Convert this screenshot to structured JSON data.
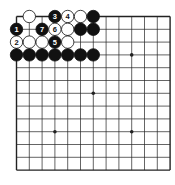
{
  "board": {
    "size": 13,
    "origin": [
      16.5,
      16.5
    ],
    "spacing": 12.8,
    "star_points": [
      [
        3,
        3
      ],
      [
        9,
        3
      ],
      [
        6,
        6
      ],
      [
        3,
        9
      ],
      [
        9,
        9
      ]
    ],
    "colors": {
      "line": "#222222",
      "black": "#111111",
      "white": "#ffffff",
      "background": "#ffffff"
    }
  },
  "stones": [
    {
      "col": 1,
      "row": 0,
      "color": "white",
      "label": ""
    },
    {
      "col": 3,
      "row": 0,
      "color": "black",
      "label": "3"
    },
    {
      "col": 4,
      "row": 0,
      "color": "white",
      "label": "4"
    },
    {
      "col": 5,
      "row": 0,
      "color": "white",
      "label": ""
    },
    {
      "col": 6,
      "row": 0,
      "color": "black",
      "label": ""
    },
    {
      "col": 0,
      "row": 1,
      "color": "black",
      "label": "1"
    },
    {
      "col": 2,
      "row": 1,
      "color": "black",
      "label": "7"
    },
    {
      "col": 3,
      "row": 1,
      "color": "white",
      "label": "6"
    },
    {
      "col": 4,
      "row": 1,
      "color": "white",
      "label": ""
    },
    {
      "col": 5,
      "row": 1,
      "color": "black",
      "label": ""
    },
    {
      "col": 6,
      "row": 1,
      "color": "black",
      "label": ""
    },
    {
      "col": 0,
      "row": 2,
      "color": "white",
      "label": "2"
    },
    {
      "col": 1,
      "row": 2,
      "color": "white",
      "label": ""
    },
    {
      "col": 2,
      "row": 2,
      "color": "white",
      "label": ""
    },
    {
      "col": 3,
      "row": 2,
      "color": "black",
      "label": "5"
    },
    {
      "col": 4,
      "row": 2,
      "color": "white",
      "label": ""
    },
    {
      "col": 0,
      "row": 3,
      "color": "black",
      "label": ""
    },
    {
      "col": 1,
      "row": 3,
      "color": "black",
      "label": ""
    },
    {
      "col": 2,
      "row": 3,
      "color": "black",
      "label": ""
    },
    {
      "col": 3,
      "row": 3,
      "color": "black",
      "label": ""
    },
    {
      "col": 4,
      "row": 3,
      "color": "black",
      "label": ""
    },
    {
      "col": 5,
      "row": 3,
      "color": "black",
      "label": ""
    },
    {
      "col": 6,
      "row": 3,
      "color": "black",
      "label": ""
    }
  ]
}
